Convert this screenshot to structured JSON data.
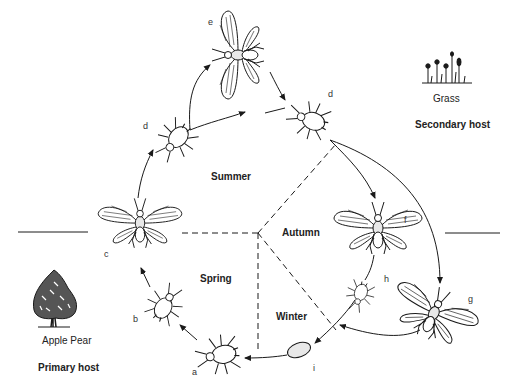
{
  "diagram": {
    "seasons": {
      "summer": "Summer",
      "autumn": "Autumn",
      "winter": "Winter",
      "spring": "Spring"
    },
    "primary_host": {
      "plants": "Apple  Pear",
      "label": "Primary host",
      "icon": "tree-icon"
    },
    "secondary_host": {
      "plants": "Grass",
      "label": "Secondary host",
      "icon": "grass-icon"
    },
    "stages": [
      {
        "id": "a",
        "label": "a",
        "form": "wingless aphid (stem mother)"
      },
      {
        "id": "b",
        "label": "b",
        "form": "wingless aphid"
      },
      {
        "id": "c",
        "label": "c",
        "form": "winged aphid"
      },
      {
        "id": "d1",
        "label": "d",
        "form": "wingless aphid"
      },
      {
        "id": "e",
        "label": "e",
        "form": "winged aphid"
      },
      {
        "id": "d2",
        "label": "d",
        "form": "wingless aphid on secondary host"
      },
      {
        "id": "f",
        "label": "f",
        "form": "winged aphid"
      },
      {
        "id": "g",
        "label": "g",
        "form": "winged male aphid"
      },
      {
        "id": "h",
        "label": "h",
        "form": "wingless sexual female"
      },
      {
        "id": "i",
        "label": "i",
        "form": "overwintering egg"
      }
    ],
    "colors": {
      "ink": "#1a1a1a",
      "background": "#ffffff",
      "body_fill": "#e8e8e8"
    }
  }
}
